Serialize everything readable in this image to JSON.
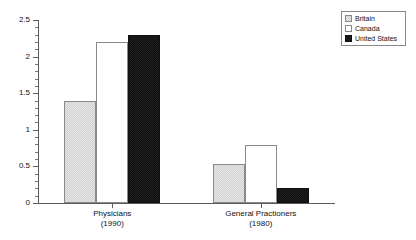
{
  "chart_data": {
    "type": "bar",
    "title": "",
    "subtitle": "",
    "xlabel": "",
    "ylabel": "",
    "ylim": [
      0,
      2.5
    ],
    "grid": false,
    "legend_position": "top-right",
    "categories": [
      "Physicians\n(1990)",
      "General Practioners\n(1980)"
    ],
    "category_labels": [
      {
        "name": "Physicians",
        "year": "(1990)"
      },
      {
        "name": "General Practioners",
        "year": "(1980)"
      }
    ],
    "y_ticks": [
      "0",
      "0.5",
      "1",
      "1.5",
      "2",
      "2.5"
    ],
    "y_tick_values": [
      0,
      0.5,
      1,
      1.5,
      2,
      2.5
    ],
    "y_minor_step": 0.1,
    "series": [
      {
        "name": "Britain",
        "values": [
          1.4,
          0.53
        ],
        "fill": "#cfcfcf",
        "pattern": "stipple",
        "border": "#8a8a8a"
      },
      {
        "name": "Canada",
        "values": [
          2.2,
          0.79
        ],
        "fill": "#ffffff",
        "pattern": "none",
        "border": "#8a8a8a"
      },
      {
        "name": "United States",
        "values": [
          2.3,
          0.2
        ],
        "fill": "#0f0f0f",
        "pattern": "solid-black",
        "border": "#0f0f0f"
      }
    ]
  },
  "legend": {
    "items": [
      {
        "label": "Britain"
      },
      {
        "label": "Canada"
      },
      {
        "label": "United States"
      }
    ]
  },
  "colors": {
    "axis": "#5a5a5a",
    "text": "#111111",
    "background": "#ffffff"
  }
}
